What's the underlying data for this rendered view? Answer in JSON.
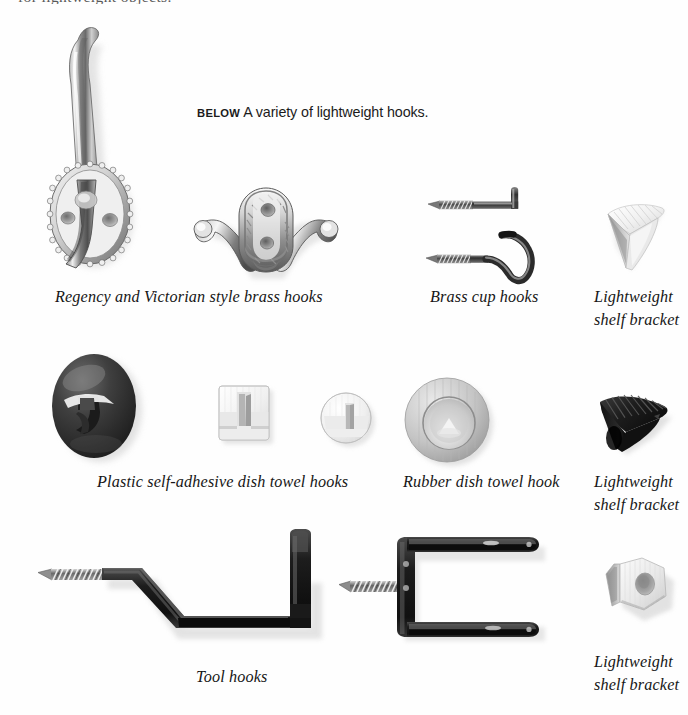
{
  "page": {
    "top_cut_text": "for lightweight objects.",
    "background_color": "#fefefe"
  },
  "caption": {
    "prefix": "BELOW",
    "text": "A variety of lightweight hooks."
  },
  "rows": [
    {
      "row_index": 1,
      "items": [
        {
          "id": "regency-victorian-brass-hooks",
          "label": "Regency and Victorian style brass hooks",
          "artwork": "brass-coat-hook-oval-beaded-backplate",
          "artwork_secondary": "brass-double-hook-rope-edge",
          "material": "polished brass",
          "color": "#9a9a9a"
        },
        {
          "id": "brass-cup-hooks",
          "label": "Brass cup hooks",
          "artwork": "brass-square-l-hook-and-round-cup-hook",
          "material": "brass",
          "color": "#4a4a4a"
        },
        {
          "id": "lightweight-shelf-bracket-white-wedge",
          "label": "Lightweight\nshelf bracket",
          "artwork": "white-plastic-wedge-shelf-support",
          "material": "white plastic",
          "color": "#e6e6e6"
        }
      ]
    },
    {
      "row_index": 2,
      "items": [
        {
          "id": "plastic-self-adhesive-dish-towel-hooks",
          "label": "Plastic self-adhesive dish towel hooks",
          "artwork": "dark-oval-adhesive-hook",
          "artwork_secondary": "white-square-adhesive-hook",
          "artwork_tertiary": "white-round-adhesive-hook",
          "material": "plastic",
          "color": "#3a3a3a"
        },
        {
          "id": "rubber-dish-towel-hook",
          "label": "Rubber dish towel hook",
          "artwork": "grey-rubber-disc-hook",
          "material": "rubber",
          "color": "#b9b9b9"
        },
        {
          "id": "lightweight-shelf-bracket-black-ribbed",
          "label": "Lightweight\nshelf bracket",
          "artwork": "black-ribbed-wedge-shelf-support",
          "material": "black plastic",
          "color": "#141414"
        }
      ]
    },
    {
      "row_index": 3,
      "items": [
        {
          "id": "tool-hooks",
          "label": "Tool hooks",
          "artwork": "large-black-screw-in-z-tool-hook",
          "artwork_secondary": "black-screw-in-double-prong-tool-hook",
          "material": "coated steel",
          "color": "#222222"
        },
        {
          "id": "lightweight-shelf-bracket-hex-peg",
          "label": "Lightweight\nshelf bracket",
          "artwork": "white-hexagonal-plastic-shelf-peg",
          "material": "white plastic",
          "color": "#d9d9d9"
        }
      ]
    }
  ]
}
